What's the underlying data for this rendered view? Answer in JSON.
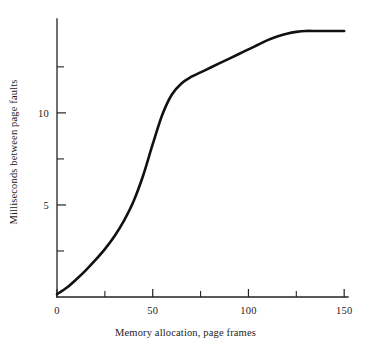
{
  "figure": {
    "background_color": "#ffffff",
    "ink_color": "#111111"
  },
  "chart_data": {
    "type": "line",
    "title": "",
    "subtitle": "",
    "xlabel": "Memory allocation, page frames",
    "ylabel": "Milliseconds between page faults",
    "xlim": [
      0,
      152
    ],
    "ylim": [
      0,
      15.1
    ],
    "grid": false,
    "legend": null,
    "legend_position": "none",
    "x_ticks_major": [
      0,
      50,
      100,
      150
    ],
    "x_tick_labels": [
      "0",
      "50",
      "100",
      "150"
    ],
    "x_ticks_minor": [
      25,
      75,
      125
    ],
    "y_ticks_major": [
      5,
      10
    ],
    "y_tick_labels": [
      "5",
      "10"
    ],
    "y_ticks_minor": [
      2.5,
      7.5,
      12.5
    ],
    "series": [
      {
        "name": "Milliseconds between page faults",
        "color": "#111111",
        "x": [
          0,
          5,
          10,
          15,
          20,
          25,
          30,
          35,
          40,
          45,
          50,
          55,
          60,
          65,
          70,
          75,
          80,
          85,
          90,
          95,
          100,
          105,
          110,
          115,
          120,
          125,
          130,
          135,
          140,
          145,
          150
        ],
        "values": [
          0.15,
          0.5,
          0.95,
          1.45,
          2.0,
          2.6,
          3.3,
          4.15,
          5.2,
          6.6,
          8.3,
          9.9,
          11.0,
          11.6,
          11.95,
          12.2,
          12.45,
          12.7,
          12.95,
          13.2,
          13.45,
          13.7,
          13.95,
          14.15,
          14.3,
          14.4,
          14.45,
          14.45,
          14.45,
          14.45,
          14.45
        ]
      }
    ]
  },
  "axis_geometry": {
    "origin_px": [
      57,
      297
    ],
    "x_axis_end_px": [
      348,
      297
    ],
    "y_axis_top_px": [
      57,
      19
    ]
  }
}
